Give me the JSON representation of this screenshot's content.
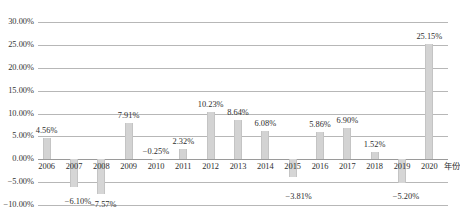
{
  "chart_data": {
    "type": "bar",
    "title": "",
    "subtitle": "",
    "xlabel": "年份",
    "ylabel": "",
    "grid": true,
    "legend": false,
    "ylim": [
      -10,
      30
    ],
    "ytick_format": "percent",
    "yticks": [
      {
        "value": 30,
        "label": "30.00%"
      },
      {
        "value": 25,
        "label": "25.00%"
      },
      {
        "value": 20,
        "label": "20.00%"
      },
      {
        "value": 15,
        "label": "15.00%"
      },
      {
        "value": 10,
        "label": "10.00%"
      },
      {
        "value": 5,
        "label": "5.00%"
      },
      {
        "value": 0,
        "label": "0.00%"
      },
      {
        "value": -5,
        "label": "−5.00%"
      },
      {
        "value": -10,
        "label": "−10.00%"
      }
    ],
    "categories": [
      "2006",
      "2007",
      "2008",
      "2009",
      "2010",
      "2011",
      "2012",
      "2013",
      "2014",
      "2015",
      "2016",
      "2017",
      "2018",
      "2019",
      "2020"
    ],
    "values": [
      4.56,
      -6.1,
      -7.57,
      7.91,
      -0.25,
      2.32,
      10.23,
      8.64,
      6.08,
      -3.81,
      5.86,
      6.9,
      1.52,
      -5.2,
      25.15
    ],
    "data_labels": [
      "4.56%",
      "−6.10%",
      "−7.57%",
      "7.91%",
      "−0.25%",
      "2.32%",
      "10.23%",
      "8.64%",
      "6.08%",
      "−3.81%",
      "5.86%",
      "6.90%",
      "1.52%",
      "−5.20%",
      "25.15%"
    ],
    "bar_color": "#d3d3d3",
    "grid_color": "#b7b7b7",
    "background_color": "#ffffff",
    "text_color": "#2e2e2e"
  }
}
